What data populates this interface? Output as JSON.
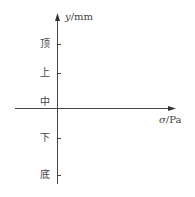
{
  "diagram": {
    "y_axis": {
      "var": "y",
      "unit": "/mm"
    },
    "x_axis": {
      "var": "σ",
      "unit": "/Pa"
    },
    "ticks": [
      {
        "label": "顶",
        "y": 44
      },
      {
        "label": "上",
        "y": 73
      },
      {
        "label": "中",
        "y": 103
      },
      {
        "label": "下",
        "y": 138
      },
      {
        "label": "底",
        "y": 175
      }
    ]
  }
}
